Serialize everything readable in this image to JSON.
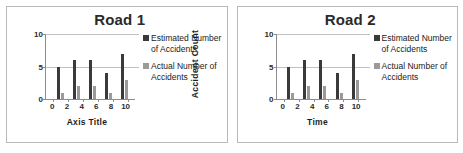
{
  "chart_data": [
    {
      "type": "bar",
      "title": "Road 1",
      "xlabel": "Axis Title",
      "ylabel": "Accident  Count",
      "categories": [
        "0",
        "2",
        "4",
        "6",
        "8",
        "10"
      ],
      "x": [
        2,
        4,
        6,
        8,
        10
      ],
      "series": [
        {
          "name": "Estimated Number of Accidents",
          "values": [
            5,
            6,
            6,
            4,
            7
          ],
          "color": "#3a3a3a"
        },
        {
          "name": "Actual Number of Accidents",
          "values": [
            1,
            2,
            2,
            1,
            3
          ],
          "color": "#9a9a9a"
        }
      ],
      "yticks": [
        0,
        5,
        10
      ],
      "ylim": [
        0,
        10
      ],
      "grid": true,
      "legend_position": "right"
    },
    {
      "type": "bar",
      "title": "Road 2",
      "xlabel": "Time",
      "ylabel": "Accident  Count",
      "categories": [
        "0",
        "2",
        "4",
        "6",
        "8",
        "10"
      ],
      "x": [
        2,
        4,
        6,
        8,
        10
      ],
      "series": [
        {
          "name": "Estimated Number of Accidents",
          "values": [
            5,
            6,
            6,
            4,
            7
          ],
          "color": "#3a3a3a"
        },
        {
          "name": "Actual Number of Accidents",
          "values": [
            1,
            2,
            2,
            1,
            3
          ],
          "color": "#9a9a9a"
        }
      ],
      "yticks": [
        0,
        5,
        10
      ],
      "ylim": [
        0,
        10
      ],
      "grid": true,
      "legend_position": "right"
    }
  ]
}
